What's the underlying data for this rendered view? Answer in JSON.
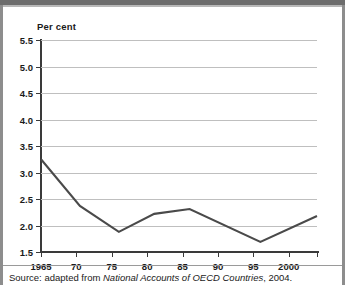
{
  "chart_data": {
    "type": "line",
    "title": "",
    "ylabel": "Per cent",
    "xlabel": "",
    "ylim": [
      1.5,
      5.5
    ],
    "xlim": [
      1965,
      2004
    ],
    "grid": true,
    "legend": "none",
    "ytick_labels": [
      "5.5",
      "5.0",
      "4.5",
      "4.0",
      "3.5",
      "3.0",
      "2.5",
      "2.0",
      "1.5"
    ],
    "ytick_values": [
      5.5,
      5.0,
      4.5,
      4.0,
      3.5,
      3.0,
      2.5,
      2.0,
      1.5
    ],
    "xtick_labels": [
      "1965",
      "70",
      "75",
      "80",
      "85",
      "90",
      "95",
      "2000",
      ""
    ],
    "xtick_values": [
      1965,
      1970,
      1975,
      1980,
      1985,
      1990,
      1995,
      2000,
      2004
    ],
    "series": [
      {
        "name": "Per cent",
        "color": "#4a4a4a",
        "x": [
          1965,
          1970.5,
          1976,
          1981,
          1986,
          1996,
          2004
        ],
        "values": [
          3.25,
          2.37,
          1.88,
          2.22,
          2.31,
          1.69,
          2.18
        ]
      }
    ]
  },
  "source": {
    "prefix": "Source: adapted from ",
    "italic": "National Accounts of OECD Countries",
    "suffix": ", 2004."
  },
  "colors": {
    "line": "#4a4a4a",
    "grid": "#bfbfbf",
    "axis": "#3a3a3a",
    "text": "#1a1a1a",
    "border": "#8d8d8d",
    "topbar": "#6d6d6d"
  }
}
